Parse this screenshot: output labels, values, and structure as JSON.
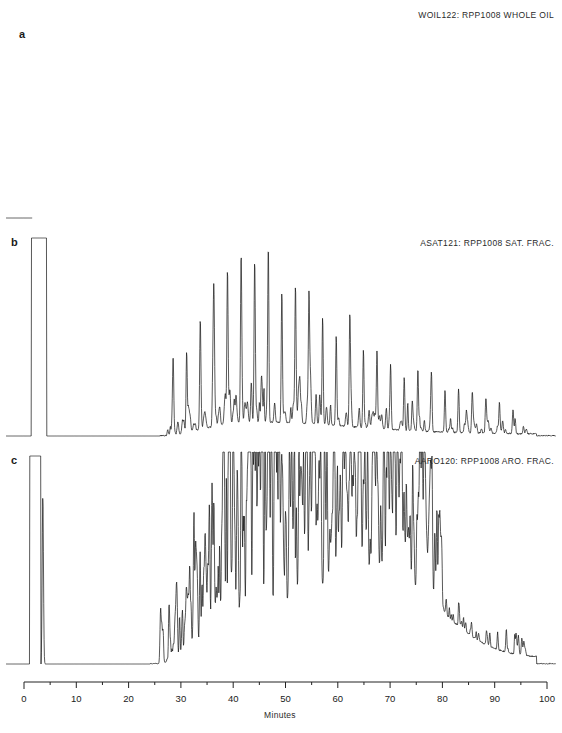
{
  "figure": {
    "width": 562,
    "height": 733,
    "background": "#ffffff",
    "trace_color": "#111111",
    "axis_color": "#222222"
  },
  "axis": {
    "label": "Minutes",
    "min": 0,
    "max": 100,
    "major_step": 10,
    "minor_step": 5,
    "tick_labels": [
      "0",
      "10",
      "20",
      "30",
      "40",
      "50",
      "60",
      "70",
      "80",
      "90",
      "100"
    ],
    "px_per_minute": 5.23,
    "x_origin_px": 24
  },
  "panels": [
    {
      "id": "a",
      "letter": "a",
      "title": "WOIL122: RPP1008 WHOLE OIL",
      "sample": "RPP1008",
      "fraction": "WHOLE OIL",
      "code": "WOIL122"
    },
    {
      "id": "b",
      "letter": "b",
      "title": "ASAT121: RPP1008 SAT. FRAC.",
      "sample": "RPP1008",
      "fraction": "SAT. FRAC.",
      "code": "ASAT121"
    },
    {
      "id": "c",
      "letter": "c",
      "title": "AARO120: RPP1008 ARO. FRAC.",
      "sample": "RPP1008",
      "fraction": "ARO. FRAC.",
      "code": "AARO120"
    }
  ],
  "chart_data": {
    "type": "line",
    "xlabel": "Minutes",
    "ylabel": "",
    "xlim": [
      0,
      100
    ],
    "grid": false,
    "legend": "none",
    "series": [
      {
        "name": "WOIL122: RPP1008 WHOLE OIL",
        "panel": "a",
        "height_px": 222,
        "baseline_px": 210,
        "solvent_peak": {
          "type": "rounded-hump",
          "start_min": 1.7,
          "end_min": 4.6,
          "top_px": 164,
          "clipped": false
        },
        "ucm": {
          "start_min": 4.8,
          "peak_min": 22.0,
          "end_min": 98.0,
          "peak_amp_px": 26,
          "tail_amp_px": 2
        },
        "alkanes": {
          "first_min": 8.0,
          "spacing_min": 2.62,
          "count": 32,
          "max_amp_px": 185,
          "rise_peak_index": 8,
          "decay": 0.9,
          "comment": "n-alkane homologous series, envelope maximum near C19"
        },
        "noise_amp_px": 14
      },
      {
        "name": "ASAT121: RPP1008 SAT. FRAC.",
        "panel": "b",
        "height_px": 216,
        "baseline_px": 204,
        "solvent_peak": {
          "type": "flat-top",
          "start_min": 1.5,
          "end_min": 4.2,
          "top_px": 6,
          "clipped": true
        },
        "ucm": {
          "start_min": 26.0,
          "peak_min": 44.0,
          "end_min": 98.0,
          "peak_amp_px": 14,
          "tail_amp_px": 2
        },
        "alkanes": {
          "first_min": 28.5,
          "spacing_min": 2.6,
          "count": 26,
          "max_amp_px": 168,
          "rise_peak_index": 6,
          "decay": 0.9,
          "comment": "clean saturate n-alkane series, minimal UCM"
        },
        "noise_amp_px": 9
      },
      {
        "name": "AARO120: RPP1008 ARO. FRAC.",
        "panel": "c",
        "height_px": 228,
        "baseline_px": 214,
        "solvent_peak": {
          "type": "flat-top",
          "start_min": 1.2,
          "end_min": 3.1,
          "top_px": 6,
          "clipped": true
        },
        "second_peak": {
          "at_min": 3.6,
          "amp_px": 168
        },
        "ucm": {
          "start_min": 25.0,
          "peak_min": 69.0,
          "end_min": 98.0,
          "peak_amp_px": 92,
          "tail_amp_px": 6,
          "comment": "large unresolved complex mixture hump typical of aromatics"
        },
        "aromatics": {
          "dense_start_min": 26.0,
          "dense_end_min": 80.0,
          "max_amp_px": 150,
          "cluster_peak_min": 44.0,
          "comment": "dense irregular aromatic peak forest on rising baseline"
        },
        "noise_amp_px": 34
      }
    ]
  }
}
